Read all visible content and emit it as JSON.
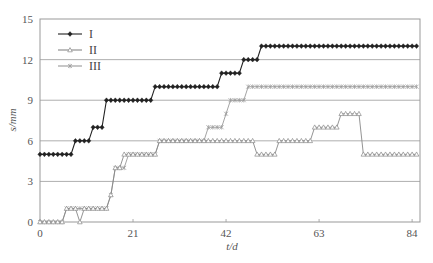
{
  "chart_data": {
    "type": "line",
    "title": "",
    "xlabel": "t/d",
    "ylabel": "s/mm",
    "xlim": [
      0,
      86
    ],
    "ylim": [
      0,
      15
    ],
    "xticks": [
      0,
      21,
      42,
      63,
      84
    ],
    "yticks": [
      0,
      3,
      6,
      9,
      12,
      15
    ],
    "grid": {
      "horizontal": true,
      "vertical": false
    },
    "legend": {
      "position": "upper-left",
      "entries": [
        "I",
        "II",
        "III"
      ]
    },
    "x": [
      0,
      1,
      2,
      3,
      4,
      5,
      6,
      7,
      8,
      9,
      10,
      11,
      12,
      13,
      14,
      15,
      16,
      17,
      18,
      19,
      20,
      21,
      22,
      23,
      24,
      25,
      26,
      27,
      28,
      29,
      30,
      31,
      32,
      33,
      34,
      35,
      36,
      37,
      38,
      39,
      40,
      41,
      42,
      43,
      44,
      45,
      46,
      47,
      48,
      49,
      50,
      51,
      52,
      53,
      54,
      55,
      56,
      57,
      58,
      59,
      60,
      61,
      62,
      63,
      64,
      65,
      66,
      67,
      68,
      69,
      70,
      71,
      72,
      73,
      74,
      75,
      76,
      77,
      78,
      79,
      80,
      81,
      82,
      83,
      84,
      85
    ],
    "series": [
      {
        "name": "I",
        "marker": "diamond-filled",
        "color": "#222222",
        "values": [
          5,
          5,
          5,
          5,
          5,
          5,
          5,
          5,
          6,
          6,
          6,
          6,
          7,
          7,
          7,
          9,
          9,
          9,
          9,
          9,
          9,
          9,
          9,
          9,
          9,
          9,
          10,
          10,
          10,
          10,
          10,
          10,
          10,
          10,
          10,
          10,
          10,
          10,
          10,
          10,
          10,
          11,
          11,
          11,
          11,
          11,
          12,
          12,
          12,
          12,
          13,
          13,
          13,
          13,
          13,
          13,
          13,
          13,
          13,
          13,
          13,
          13,
          13,
          13,
          13,
          13,
          13,
          13,
          13,
          13,
          13,
          13,
          13,
          13,
          13,
          13,
          13,
          13,
          13,
          13,
          13,
          13,
          13,
          13,
          13,
          13
        ]
      },
      {
        "name": "II",
        "marker": "triangle-open",
        "color": "#888888",
        "values": [
          0,
          0,
          0,
          0,
          0,
          0,
          1,
          1,
          1,
          0,
          1,
          1,
          1,
          1,
          1,
          1,
          2,
          4,
          4,
          5,
          5,
          5,
          5,
          5,
          5,
          5,
          5,
          6,
          6,
          6,
          6,
          6,
          6,
          6,
          6,
          6,
          6,
          6,
          6,
          6,
          6,
          6,
          6,
          6,
          6,
          6,
          6,
          6,
          6,
          5,
          5,
          5,
          5,
          5,
          6,
          6,
          6,
          6,
          6,
          6,
          6,
          6,
          7,
          7,
          7,
          7,
          7,
          7,
          8,
          8,
          8,
          8,
          8,
          5,
          5,
          5,
          5,
          5,
          5,
          5,
          5,
          5,
          5,
          5,
          5,
          5
        ]
      },
      {
        "name": "III",
        "marker": "asterisk",
        "color": "#999999",
        "values": [
          0,
          0,
          0,
          0,
          0,
          0,
          1,
          1,
          1,
          1,
          1,
          1,
          1,
          1,
          1,
          1,
          2,
          4,
          4,
          4,
          5,
          5,
          5,
          5,
          5,
          5,
          5,
          6,
          6,
          6,
          6,
          6,
          6,
          6,
          6,
          6,
          6,
          6,
          7,
          7,
          7,
          7,
          8,
          9,
          9,
          9,
          9,
          10,
          10,
          10,
          10,
          10,
          10,
          10,
          10,
          10,
          10,
          10,
          10,
          10,
          10,
          10,
          10,
          10,
          10,
          10,
          10,
          10,
          10,
          10,
          10,
          10,
          10,
          10,
          10,
          10,
          10,
          10,
          10,
          10,
          10,
          10,
          10,
          10,
          10,
          10
        ]
      }
    ]
  },
  "labels": {
    "y_axis": "s/mm",
    "x_axis": "t/d",
    "legend": [
      "I",
      "II",
      "III"
    ]
  }
}
